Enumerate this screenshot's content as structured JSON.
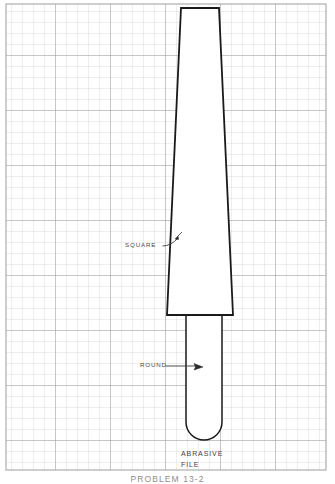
{
  "sheet": {
    "width": 335,
    "height": 484,
    "background_color": "#ffffff"
  },
  "grid": {
    "cell_size": 11,
    "minor_line_color": "#c8c8c8",
    "major_line_color": "#9a9a9a",
    "major_every": 5,
    "left": 6,
    "top": 4,
    "right": 326,
    "bottom": 470
  },
  "drawing": {
    "line_color": "#1a1a1a",
    "fill_color": "#ffffff",
    "square_body": {
      "top_left_x": 181,
      "top_right_x": 219,
      "top_y": 8,
      "bottom_left_x": 167,
      "bottom_right_x": 233,
      "bottom_y": 315
    },
    "round_tang": {
      "left_x": 186,
      "right_x": 222,
      "top_y": 315,
      "bottom_y": 440,
      "radius": 18
    }
  },
  "annotations": {
    "square": {
      "label": "SQUARE",
      "leader_start_x": 163,
      "leader_start_y": 246,
      "leader_mid_x": 172,
      "leader_mid_y": 244,
      "arrow_tip_x": 181,
      "arrow_tip_y": 233
    },
    "round": {
      "label": "ROUND",
      "leader_start_x": 166,
      "leader_start_y": 366,
      "arrow_tip_x": 202,
      "arrow_tip_y": 367
    }
  },
  "title_block": {
    "line1": "ABRASIVE",
    "line2": "FILE"
  },
  "caption": {
    "text": "PROBLEM 13-2"
  }
}
